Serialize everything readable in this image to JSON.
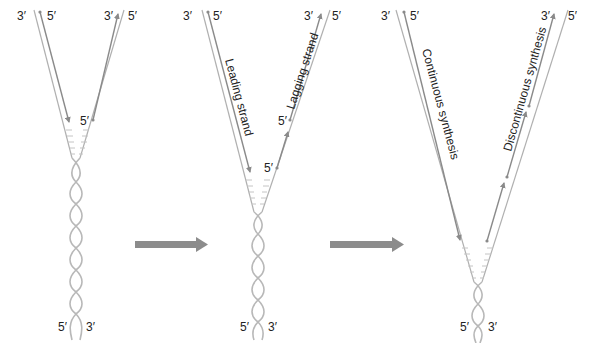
{
  "diagram": {
    "colors": {
      "template_strand": "#b0b0b0",
      "new_strand": "#8a8a8a",
      "helix": "#b8b8b8",
      "process_arrow": "#8c8c8c",
      "label_text": "#222222"
    },
    "panels": [
      {
        "id": "panel-1",
        "labels": {
          "top_left_outer": "3′",
          "top_left_inner": "5′",
          "top_right_inner": "3′",
          "top_right_outer": "5′",
          "right_primer": "5′",
          "bottom_left": "5′",
          "bottom_right": "3′"
        }
      },
      {
        "id": "panel-2",
        "labels": {
          "top_left_outer": "3′",
          "top_left_inner": "5′",
          "top_right_inner": "3′",
          "top_right_outer": "5′",
          "right_primer_upper": "5′",
          "right_primer_lower": "5′",
          "bottom_left": "5′",
          "bottom_right": "3′"
        },
        "strand_labels": {
          "leading": "Leading strand",
          "lagging": "Lagging strand"
        }
      },
      {
        "id": "panel-3",
        "labels": {
          "top_left_outer": "3′",
          "top_left_inner": "5′",
          "top_right_inner": "3′",
          "top_right_outer": "5′",
          "bottom_left": "5′",
          "bottom_right": "3′"
        },
        "strand_labels": {
          "continuous": "Continuous synthesis",
          "discontinuous": "Discontinuous synthesis"
        }
      }
    ],
    "process_arrows": [
      {
        "from": "panel-1",
        "to": "panel-2"
      },
      {
        "from": "panel-2",
        "to": "panel-3"
      }
    ]
  }
}
